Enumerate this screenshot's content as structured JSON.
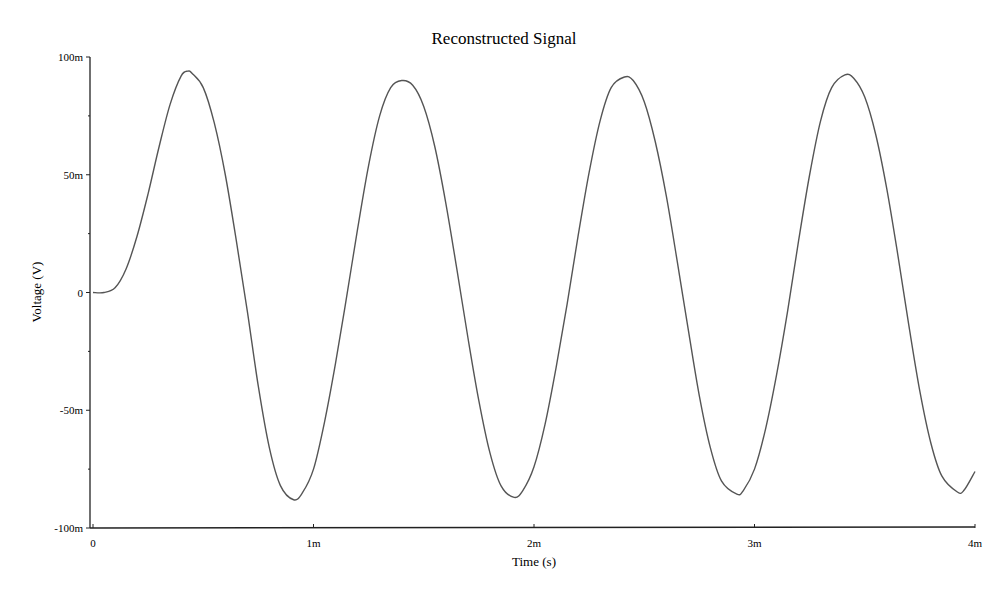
{
  "chart_data": {
    "type": "line",
    "title": "Reconstructed Signal",
    "xlabel": "Time (s)",
    "ylabel": "Voltage (V)",
    "xlim": [
      0,
      0.004
    ],
    "ylim": [
      -0.1,
      0.1
    ],
    "x_ticks": [
      {
        "value": 0,
        "label": "0"
      },
      {
        "value": 0.001,
        "label": "1m"
      },
      {
        "value": 0.002,
        "label": "2m"
      },
      {
        "value": 0.003,
        "label": "3m"
      },
      {
        "value": 0.004,
        "label": "4m"
      }
    ],
    "y_ticks": [
      {
        "value": 0.1,
        "label": "100m"
      },
      {
        "value": 0.05,
        "label": "50m"
      },
      {
        "value": 0,
        "label": "0"
      },
      {
        "value": -0.05,
        "label": "-50m"
      },
      {
        "value": -0.1,
        "label": "-100m"
      }
    ],
    "y_minor_ticks": [
      0.075,
      0.025,
      -0.025,
      -0.075
    ],
    "grid": false,
    "legend": null,
    "series": [
      {
        "name": "Reconstructed Signal",
        "color": "#555555",
        "x_unit": "s",
        "y_unit": "V",
        "points": [
          [
            0.0,
            0.0
          ],
          [
            5e-05,
            0.0
          ],
          [
            0.0001,
            0.002
          ],
          [
            0.00015,
            0.01
          ],
          [
            0.0002,
            0.024
          ],
          [
            0.00025,
            0.042
          ],
          [
            0.0003,
            0.062
          ],
          [
            0.00035,
            0.08
          ],
          [
            0.0004,
            0.092
          ],
          [
            0.00043,
            0.094
          ],
          [
            0.00045,
            0.093
          ],
          [
            0.0005,
            0.087
          ],
          [
            0.00055,
            0.072
          ],
          [
            0.0006,
            0.05
          ],
          [
            0.00065,
            0.022
          ],
          [
            0.0007,
            -0.008
          ],
          [
            0.00075,
            -0.04
          ],
          [
            0.0008,
            -0.066
          ],
          [
            0.00085,
            -0.082
          ],
          [
            0.00091,
            -0.088
          ],
          [
            0.00095,
            -0.085
          ],
          [
            0.001,
            -0.075
          ],
          [
            0.00105,
            -0.055
          ],
          [
            0.0011,
            -0.03
          ],
          [
            0.00115,
            -0.002
          ],
          [
            0.0012,
            0.027
          ],
          [
            0.00125,
            0.054
          ],
          [
            0.0013,
            0.075
          ],
          [
            0.00135,
            0.087
          ],
          [
            0.0014,
            0.09
          ],
          [
            0.00145,
            0.088
          ],
          [
            0.0015,
            0.079
          ],
          [
            0.00155,
            0.062
          ],
          [
            0.0016,
            0.038
          ],
          [
            0.00165,
            0.01
          ],
          [
            0.0017,
            -0.019
          ],
          [
            0.00175,
            -0.046
          ],
          [
            0.0018,
            -0.068
          ],
          [
            0.00185,
            -0.082
          ],
          [
            0.00191,
            -0.087
          ],
          [
            0.00195,
            -0.084
          ],
          [
            0.002,
            -0.074
          ],
          [
            0.00205,
            -0.056
          ],
          [
            0.0021,
            -0.032
          ],
          [
            0.00215,
            -0.005
          ],
          [
            0.0022,
            0.024
          ],
          [
            0.00225,
            0.051
          ],
          [
            0.0023,
            0.073
          ],
          [
            0.00235,
            0.087
          ],
          [
            0.00241,
            0.0915
          ],
          [
            0.00245,
            0.09
          ],
          [
            0.0025,
            0.081
          ],
          [
            0.00255,
            0.064
          ],
          [
            0.0026,
            0.041
          ],
          [
            0.00265,
            0.013
          ],
          [
            0.0027,
            -0.016
          ],
          [
            0.00275,
            -0.044
          ],
          [
            0.0028,
            -0.066
          ],
          [
            0.00285,
            -0.08
          ],
          [
            0.00292,
            -0.0856
          ],
          [
            0.00295,
            -0.084
          ],
          [
            0.003,
            -0.075
          ],
          [
            0.00305,
            -0.058
          ],
          [
            0.0031,
            -0.035
          ],
          [
            0.00315,
            -0.008
          ],
          [
            0.0032,
            0.022
          ],
          [
            0.00325,
            0.05
          ],
          [
            0.0033,
            0.073
          ],
          [
            0.00335,
            0.087
          ],
          [
            0.00341,
            0.0924
          ],
          [
            0.00345,
            0.091
          ],
          [
            0.0035,
            0.083
          ],
          [
            0.00355,
            0.067
          ],
          [
            0.0036,
            0.044
          ],
          [
            0.00365,
            0.016
          ],
          [
            0.0037,
            -0.014
          ],
          [
            0.00375,
            -0.042
          ],
          [
            0.0038,
            -0.064
          ],
          [
            0.00385,
            -0.078
          ],
          [
            0.00392,
            -0.0847
          ],
          [
            0.00395,
            -0.084
          ],
          [
            0.004,
            -0.076
          ]
        ]
      }
    ]
  }
}
